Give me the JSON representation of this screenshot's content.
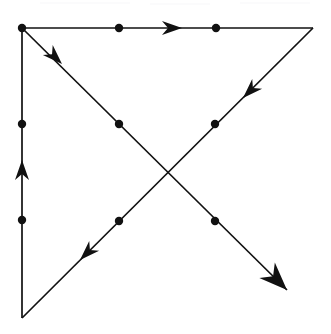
{
  "figure": {
    "background_color": "#ffffff",
    "ink_color": "#111111",
    "width": 331,
    "height": 334
  },
  "style": {
    "edge_stroke_width": 1.7,
    "vertex_radius": 4.2,
    "arrow_length_mid": 20,
    "arrow_half_width_mid": 7,
    "arrow_length_terminal": 28,
    "arrow_half_width_terminal": 11
  },
  "nodes": [
    {
      "id": "top-left",
      "label": "top-left corner vertex",
      "x": 22,
      "y": 28,
      "dot": true
    },
    {
      "id": "top-mid-left",
      "label": "top edge first dot",
      "x": 119,
      "y": 28,
      "dot": true
    },
    {
      "id": "top-mid-right",
      "label": "top edge second dot",
      "x": 216,
      "y": 28,
      "dot": true
    },
    {
      "id": "top-right",
      "label": "top-right corner vertex",
      "x": 313,
      "y": 28,
      "dot": false
    },
    {
      "id": "left-mid-up",
      "label": "left edge upper dot",
      "x": 22,
      "y": 124,
      "dot": true
    },
    {
      "id": "left-mid-low",
      "label": "left edge lower dot",
      "x": 22,
      "y": 220,
      "dot": true
    },
    {
      "id": "bottom-left",
      "label": "bottom-left corner vertex",
      "x": 22,
      "y": 318,
      "dot": false
    },
    {
      "id": "main-diag-1",
      "label": "main diagonal upper dot",
      "x": 119,
      "y": 124,
      "dot": true
    },
    {
      "id": "main-diag-2",
      "label": "main diagonal lower dot",
      "x": 215,
      "y": 221,
      "dot": true
    },
    {
      "id": "anti-diag-1",
      "label": "anti diagonal upper dot",
      "x": 215,
      "y": 124,
      "dot": true
    },
    {
      "id": "anti-diag-2",
      "label": "anti diagonal lower dot",
      "x": 119,
      "y": 221,
      "dot": true
    },
    {
      "id": "crossing",
      "label": "diagonal crossing point",
      "x": 167,
      "y": 173,
      "dot": false
    },
    {
      "id": "arrow-terminus",
      "label": "bottom-right arrow terminus",
      "x": 287,
      "y": 290,
      "dot": false
    }
  ],
  "edges": [
    {
      "id": "edge-top",
      "label": "top edge, left to right",
      "from": "top-left",
      "to": "top-right",
      "x1": 22,
      "y1": 28,
      "x2": 313,
      "y2": 28,
      "direction": "right"
    },
    {
      "id": "edge-left",
      "label": "left edge, bottom to top",
      "from": "bottom-left",
      "to": "top-left",
      "x1": 22,
      "y1": 318,
      "x2": 22,
      "y2": 28,
      "direction": "up"
    },
    {
      "id": "edge-main-diagonal",
      "label": "main diagonal, top-left to bottom-right",
      "from": "top-left",
      "to": "arrow-terminus",
      "x1": 22,
      "y1": 28,
      "x2": 287,
      "y2": 290,
      "direction": "down-right"
    },
    {
      "id": "edge-anti-diagonal",
      "label": "anti diagonal, top-right to bottom-left",
      "from": "top-right",
      "to": "bottom-left",
      "x1": 313,
      "y1": 28,
      "x2": 22,
      "y2": 318,
      "direction": "down-left"
    }
  ],
  "arrows": [
    {
      "id": "arrow-top-edge",
      "label": "rightward arrow on top edge",
      "edge": "edge-top",
      "tip_x": 182,
      "tip_y": 28,
      "angle_deg": 0,
      "size": "mid"
    },
    {
      "id": "arrow-left-edge",
      "label": "upward arrow on left edge",
      "edge": "edge-left",
      "tip_x": 22,
      "tip_y": 160,
      "angle_deg": 270,
      "size": "mid"
    },
    {
      "id": "arrow-main-upper",
      "label": "down-right arrow near top-left",
      "edge": "edge-main-diagonal",
      "tip_x": 62,
      "tip_y": 64,
      "angle_deg": 44.7,
      "size": "mid"
    },
    {
      "id": "arrow-main-terminal",
      "label": "terminal down-right arrowhead",
      "edge": "edge-main-diagonal",
      "tip_x": 287,
      "tip_y": 290,
      "angle_deg": 44.7,
      "size": "terminal"
    },
    {
      "id": "arrow-anti-upper",
      "label": "down-left arrow near top-right",
      "edge": "edge-anti-diagonal",
      "tip_x": 243,
      "tip_y": 98,
      "angle_deg": 135.1,
      "size": "mid"
    },
    {
      "id": "arrow-anti-lower",
      "label": "down-left arrow near bottom-left",
      "edge": "edge-anti-diagonal",
      "tip_x": 80,
      "tip_y": 260,
      "angle_deg": 135.1,
      "size": "mid"
    }
  ],
  "scan_noise": [
    {
      "x": 40,
      "y": 2,
      "w": 90,
      "h": 2
    },
    {
      "x": 150,
      "y": 3,
      "w": 60,
      "h": 2
    },
    {
      "x": 240,
      "y": 2,
      "w": 70,
      "h": 2
    }
  ]
}
